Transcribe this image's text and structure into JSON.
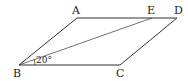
{
  "diagram": {
    "type": "parallelogram",
    "points": {
      "A": {
        "label": "A",
        "x": 77,
        "y": 18
      },
      "E": {
        "label": "E",
        "x": 152,
        "y": 18
      },
      "D": {
        "label": "D",
        "x": 177,
        "y": 18
      },
      "B": {
        "label": "B",
        "x": 19,
        "y": 65
      },
      "C": {
        "label": "C",
        "x": 120,
        "y": 65
      }
    },
    "segments": [
      "AB",
      "AD",
      "DC",
      "BC",
      "BE"
    ],
    "angle_label": "20°",
    "colors": {
      "stroke": "#333333",
      "background": "#ffffff"
    }
  }
}
